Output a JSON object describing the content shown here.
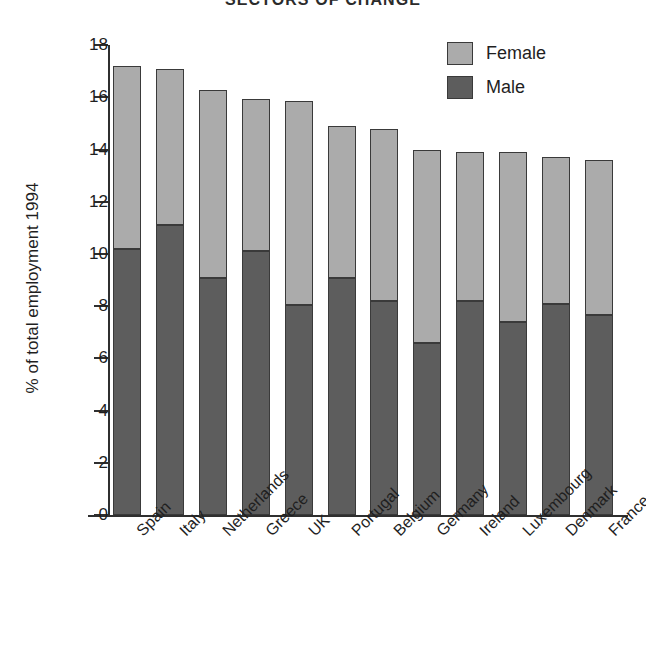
{
  "chart_data": {
    "type": "bar",
    "subtype": "stacked-vertical",
    "title": "SECTORS OF CHANGE",
    "xlabel": "",
    "ylabel": "% of total employment 1994",
    "ylim": [
      0,
      18
    ],
    "yticks": [
      0,
      2,
      4,
      6,
      8,
      10,
      12,
      14,
      16,
      18
    ],
    "ytick_labels": [
      "0",
      "2",
      "4",
      "6",
      "8",
      "10",
      "12",
      "14",
      "16",
      "18"
    ],
    "grid": false,
    "legend_position": "top-right",
    "categories": [
      "Spain",
      "Italy",
      "Netherlands",
      "Greece",
      "UK",
      "Portugal",
      "Belgium",
      "Germany",
      "Ireland",
      "Luxembourg",
      "Denmark",
      "France"
    ],
    "series": [
      {
        "name": "Male",
        "color": "#5d5d5d",
        "values": [
          10.2,
          11.1,
          9.1,
          10.1,
          8.05,
          9.1,
          8.2,
          6.6,
          8.2,
          7.4,
          8.1,
          7.65
        ]
      },
      {
        "name": "Female",
        "color": "#ababab",
        "values": [
          7.0,
          6.0,
          7.2,
          5.85,
          7.8,
          5.8,
          6.6,
          7.4,
          5.7,
          6.5,
          5.6,
          5.95
        ]
      }
    ],
    "totals": [
      17.2,
      17.1,
      16.3,
      15.95,
      15.85,
      14.9,
      14.8,
      14.0,
      13.9,
      13.9,
      13.7,
      13.6
    ]
  },
  "legend": {
    "items": [
      {
        "label": "Female",
        "color": "#ababab"
      },
      {
        "label": "Male",
        "color": "#5d5d5d"
      }
    ]
  },
  "colors": {
    "female": "#ababab",
    "male": "#5d5d5d",
    "outline": "#3a3a3a",
    "axis": "#2f2f2f",
    "text": "#1f1f1f",
    "background": "#ffffff"
  }
}
